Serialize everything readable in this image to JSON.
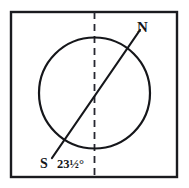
{
  "figure": {
    "labels": {
      "north_pole": "N",
      "south_pole": "S",
      "tilt_angle": "23½°"
    },
    "colors": {
      "ink": "#15161a",
      "background": "#ffffff",
      "frame": "#1a1b1f",
      "dashed_guide": "#262730"
    },
    "geometry": {
      "frame": {
        "x": 11,
        "y": 12,
        "width": 166,
        "height": 165,
        "stroke_width": 2.4
      },
      "circle": {
        "cx": 94.5,
        "cy": 93,
        "r": 55.5,
        "stroke_width": 2.2
      },
      "vertical_guide": {
        "x": 94.5,
        "y1": 12,
        "y2": 177,
        "dash": "7 5",
        "stroke_width": 1.8
      },
      "axis_line": {
        "x1": 140,
        "y1": 30,
        "x2": 52,
        "y2": 158,
        "stroke_width": 2.2
      },
      "tilt_degrees": 23.5
    },
    "label_positions": {
      "north_pole": {
        "x": 137,
        "y": 32
      },
      "south_pole": {
        "x": 40,
        "y": 168
      },
      "tilt_angle": {
        "x": 57,
        "y": 168
      }
    }
  }
}
